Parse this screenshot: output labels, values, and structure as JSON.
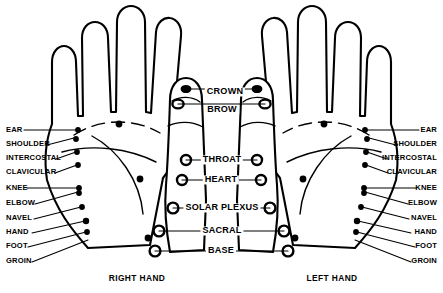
{
  "diagram": {
    "background_color": "#ffffff",
    "line_color": "#000000"
  },
  "captions": [
    {
      "text": "RIGHT HAND",
      "x": 137,
      "y": 274
    },
    {
      "text": "LEFT HAND",
      "x": 332,
      "y": 274
    }
  ],
  "center_labels": [
    {
      "text": "CROWN",
      "x": 225,
      "y": 92
    },
    {
      "text": "BROW",
      "x": 222,
      "y": 110
    },
    {
      "text": "THROAT",
      "x": 222,
      "y": 160
    },
    {
      "text": "HEART",
      "x": 221,
      "y": 180
    },
    {
      "text": "SOLAR PLEXUS",
      "x": 222,
      "y": 208
    },
    {
      "text": "SACRAL",
      "x": 222,
      "y": 231
    },
    {
      "text": "BASE",
      "x": 221,
      "y": 251
    }
  ],
  "left_labels": [
    {
      "text": "EAR",
      "x": 6,
      "y": 130
    },
    {
      "text": "SHOULDER",
      "x": 6,
      "y": 144
    },
    {
      "text": "INTERCOSTAL",
      "x": 6,
      "y": 158
    },
    {
      "text": "CLAVICULAR",
      "x": 6,
      "y": 172
    },
    {
      "text": "KNEE",
      "x": 6,
      "y": 188
    },
    {
      "text": "ELBOW",
      "x": 6,
      "y": 203
    },
    {
      "text": "NAVEL",
      "x": 6,
      "y": 218
    },
    {
      "text": "HAND",
      "x": 6,
      "y": 232
    },
    {
      "text": "FOOT",
      "x": 6,
      "y": 246
    },
    {
      "text": "GROIN",
      "x": 6,
      "y": 261
    }
  ],
  "right_labels": [
    {
      "text": "EAR",
      "x": 437,
      "y": 130
    },
    {
      "text": "SHOULDER",
      "x": 437,
      "y": 144
    },
    {
      "text": "INTERCOSTAL",
      "x": 437,
      "y": 158
    },
    {
      "text": "CLAVICULAR",
      "x": 437,
      "y": 172
    },
    {
      "text": "KNEE",
      "x": 437,
      "y": 188
    },
    {
      "text": "ELBOW",
      "x": 437,
      "y": 203
    },
    {
      "text": "NAVEL",
      "x": 437,
      "y": 218
    },
    {
      "text": "HAND",
      "x": 437,
      "y": 232
    },
    {
      "text": "FOOT",
      "x": 437,
      "y": 246
    },
    {
      "text": "GROIN",
      "x": 437,
      "y": 261
    }
  ],
  "left_leaders": [
    {
      "x1": 24,
      "y1": 130,
      "x2": 78,
      "y2": 130
    },
    {
      "x1": 47,
      "y1": 145,
      "x2": 74,
      "y2": 138
    },
    {
      "x1": 56,
      "y1": 159,
      "x2": 76,
      "y2": 152
    },
    {
      "x1": 55,
      "y1": 173,
      "x2": 77,
      "y2": 165
    },
    {
      "x1": 27,
      "y1": 188,
      "x2": 79,
      "y2": 188
    },
    {
      "x1": 35,
      "y1": 204,
      "x2": 78,
      "y2": 192
    },
    {
      "x1": 34,
      "y1": 219,
      "x2": 81,
      "y2": 207
    },
    {
      "x1": 32,
      "y1": 233,
      "x2": 85,
      "y2": 221
    },
    {
      "x1": 28,
      "y1": 247,
      "x2": 86,
      "y2": 232
    },
    {
      "x1": 32,
      "y1": 262,
      "x2": 88,
      "y2": 240
    }
  ],
  "right_leaders": [
    {
      "x1": 419,
      "y1": 130,
      "x2": 365,
      "y2": 130
    },
    {
      "x1": 396,
      "y1": 145,
      "x2": 369,
      "y2": 138
    },
    {
      "x1": 387,
      "y1": 159,
      "x2": 367,
      "y2": 152
    },
    {
      "x1": 388,
      "y1": 173,
      "x2": 366,
      "y2": 165
    },
    {
      "x1": 416,
      "y1": 188,
      "x2": 364,
      "y2": 188
    },
    {
      "x1": 408,
      "y1": 204,
      "x2": 365,
      "y2": 192
    },
    {
      "x1": 409,
      "y1": 219,
      "x2": 362,
      "y2": 207
    },
    {
      "x1": 411,
      "y1": 233,
      "x2": 358,
      "y2": 221
    },
    {
      "x1": 415,
      "y1": 247,
      "x2": 357,
      "y2": 232
    },
    {
      "x1": 411,
      "y1": 262,
      "x2": 355,
      "y2": 240
    }
  ],
  "right_hand": {
    "name": "RIGHT HAND",
    "edge_points": [
      {
        "x": 78,
        "y": 130
      },
      {
        "x": 76,
        "y": 139
      },
      {
        "x": 77,
        "y": 152
      },
      {
        "x": 78,
        "y": 165
      },
      {
        "x": 79,
        "y": 188
      },
      {
        "x": 79,
        "y": 193
      },
      {
        "x": 82,
        "y": 207
      },
      {
        "x": 86,
        "y": 221
      },
      {
        "x": 87,
        "y": 232
      }
    ],
    "palm_points": [
      {
        "x": 119,
        "y": 124
      },
      {
        "x": 140,
        "y": 179
      },
      {
        "x": 148,
        "y": 238
      }
    ]
  },
  "left_hand": {
    "name": "LEFT HAND",
    "edge_points": [
      {
        "x": 365,
        "y": 130
      },
      {
        "x": 367,
        "y": 139
      },
      {
        "x": 366,
        "y": 152
      },
      {
        "x": 365,
        "y": 165
      },
      {
        "x": 364,
        "y": 188
      },
      {
        "x": 364,
        "y": 193
      },
      {
        "x": 361,
        "y": 207
      },
      {
        "x": 357,
        "y": 221
      },
      {
        "x": 356,
        "y": 232
      }
    ],
    "palm_points": [
      {
        "x": 324,
        "y": 124
      },
      {
        "x": 303,
        "y": 179
      },
      {
        "x": 295,
        "y": 238
      }
    ]
  },
  "chakra_ring_points": {
    "right_thumb": [
      {
        "name": "crown",
        "x": 183,
        "y": 92
      },
      {
        "name": "brow",
        "x": 178,
        "y": 104
      },
      {
        "name": "throat",
        "x": 186,
        "y": 160
      },
      {
        "name": "heart",
        "x": 182,
        "y": 180
      },
      {
        "name": "solar-plexus",
        "x": 173,
        "y": 208
      },
      {
        "name": "sacral",
        "x": 159,
        "y": 231
      },
      {
        "name": "base",
        "x": 155,
        "y": 251
      }
    ],
    "left_thumb": [
      {
        "name": "crown",
        "x": 260,
        "y": 92
      },
      {
        "name": "brow",
        "x": 265,
        "y": 104
      },
      {
        "name": "throat",
        "x": 257,
        "y": 160
      },
      {
        "name": "heart",
        "x": 261,
        "y": 180
      },
      {
        "name": "solar-plexus",
        "x": 270,
        "y": 208
      },
      {
        "name": "sacral",
        "x": 284,
        "y": 231
      },
      {
        "name": "base",
        "x": 288,
        "y": 251
      }
    ]
  }
}
